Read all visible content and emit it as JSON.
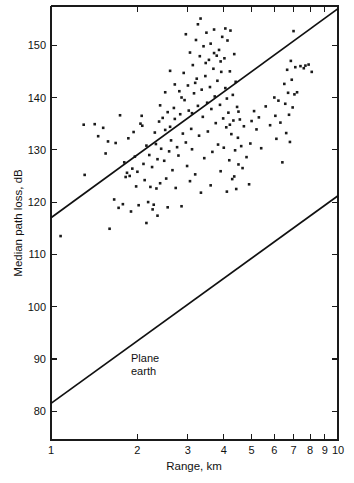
{
  "chart_data": {
    "type": "scatter",
    "title": "",
    "subtitle": "",
    "xlabel": "Range, km",
    "ylabel": "Median path loss, dB",
    "xscale": "log",
    "yscale": "linear",
    "xlim": [
      1,
      10
    ],
    "ylim": [
      74.5,
      157.5
    ],
    "grid": false,
    "legend_position": "none",
    "xticks": [
      1,
      2,
      3,
      4,
      5,
      6,
      7,
      8,
      9,
      10
    ],
    "xtick_labels": [
      "1",
      "2",
      "3",
      "4",
      "5",
      "6",
      "7",
      "8",
      "9",
      "10"
    ],
    "yticks": [
      80,
      90,
      100,
      110,
      120,
      130,
      140,
      150
    ],
    "ytick_labels": [
      "80",
      "90",
      "100",
      "110",
      "120",
      "130",
      "140",
      "150"
    ],
    "annotations": [
      {
        "name": "plane-earth-label",
        "lines": [
          "Plane",
          "earth"
        ],
        "x": 1.9,
        "y": 89.5
      }
    ],
    "series": [
      {
        "name": "measured-median-path-loss",
        "type": "scatter",
        "marker": "dot",
        "marker_size": 1.6,
        "color": "#1a1a1a",
        "points": [
          [
            1.08,
            113.5
          ],
          [
            1.3,
            134.8
          ],
          [
            1.31,
            125.2
          ],
          [
            1.42,
            134.9
          ],
          [
            1.46,
            132.6
          ],
          [
            1.52,
            134.2
          ],
          [
            1.55,
            129.3
          ],
          [
            1.58,
            131.6
          ],
          [
            1.6,
            114.9
          ],
          [
            1.66,
            120.5
          ],
          [
            1.68,
            131.3
          ],
          [
            1.72,
            118.9
          ],
          [
            1.74,
            136.6
          ],
          [
            1.78,
            119.6
          ],
          [
            1.8,
            127.6
          ],
          [
            1.82,
            124.8
          ],
          [
            1.84,
            125.6
          ],
          [
            1.86,
            132.2
          ],
          [
            1.88,
            125.0
          ],
          [
            1.9,
            118.2
          ],
          [
            1.92,
            126.4
          ],
          [
            1.94,
            133.4
          ],
          [
            1.96,
            128.7
          ],
          [
            1.98,
            123.0
          ],
          [
            2.0,
            125.8
          ],
          [
            2.02,
            119.4
          ],
          [
            2.05,
            135.0
          ],
          [
            2.08,
            134.6
          ],
          [
            2.1,
            127.3
          ],
          [
            2.12,
            124.2
          ],
          [
            2.15,
            130.8
          ],
          [
            2.18,
            120.0
          ],
          [
            2.2,
            129.0
          ],
          [
            2.22,
            122.9
          ],
          [
            2.25,
            126.7
          ],
          [
            2.28,
            119.5
          ],
          [
            2.3,
            133.3
          ],
          [
            2.32,
            131.1
          ],
          [
            2.35,
            128.2
          ],
          [
            2.38,
            135.4
          ],
          [
            2.4,
            123.6
          ],
          [
            2.42,
            130.2
          ],
          [
            2.45,
            136.1
          ],
          [
            2.48,
            127.9
          ],
          [
            2.5,
            133.8
          ],
          [
            2.52,
            124.5
          ],
          [
            2.55,
            137.2
          ],
          [
            2.58,
            129.7
          ],
          [
            2.6,
            134.4
          ],
          [
            2.62,
            131.8
          ],
          [
            2.65,
            126.1
          ],
          [
            2.68,
            138.0
          ],
          [
            2.7,
            135.9
          ],
          [
            2.72,
            122.7
          ],
          [
            2.75,
            130.5
          ],
          [
            2.78,
            128.9
          ],
          [
            2.8,
            141.2
          ],
          [
            2.82,
            136.8
          ],
          [
            2.85,
            119.2
          ],
          [
            2.88,
            133.1
          ],
          [
            2.9,
            144.7
          ],
          [
            2.92,
            139.5
          ],
          [
            2.95,
            131.4
          ],
          [
            2.98,
            126.9
          ],
          [
            3.0,
            142.3
          ],
          [
            3.02,
            137.5
          ],
          [
            3.05,
            148.6
          ],
          [
            3.08,
            134.0
          ],
          [
            3.1,
            130.1
          ],
          [
            3.12,
            146.2
          ],
          [
            3.15,
            140.8
          ],
          [
            3.18,
            125.3
          ],
          [
            3.2,
            151.0
          ],
          [
            3.22,
            143.6
          ],
          [
            3.25,
            138.4
          ],
          [
            3.28,
            132.7
          ],
          [
            3.3,
            147.9
          ],
          [
            3.32,
            155.1
          ],
          [
            3.35,
            141.5
          ],
          [
            3.38,
            136.3
          ],
          [
            3.4,
            149.8
          ],
          [
            3.42,
            128.4
          ],
          [
            3.45,
            144.1
          ],
          [
            3.48,
            152.4
          ],
          [
            3.5,
            139.0
          ],
          [
            3.52,
            133.5
          ],
          [
            3.55,
            147.2
          ],
          [
            3.58,
            142.0
          ],
          [
            3.6,
            150.3
          ],
          [
            3.62,
            137.8
          ],
          [
            3.65,
            129.6
          ],
          [
            3.68,
            145.5
          ],
          [
            3.7,
            153.0
          ],
          [
            3.72,
            140.2
          ],
          [
            3.75,
            135.1
          ],
          [
            3.78,
            148.0
          ],
          [
            3.8,
            143.2
          ],
          [
            3.82,
            131.0
          ],
          [
            3.85,
            149.1
          ],
          [
            3.88,
            138.6
          ],
          [
            3.9,
            125.9
          ],
          [
            3.92,
            144.9
          ],
          [
            3.95,
            151.6
          ],
          [
            3.98,
            136.0
          ],
          [
            4.0,
            130.4
          ],
          [
            4.02,
            147.5
          ],
          [
            4.05,
            141.8
          ],
          [
            4.08,
            134.3
          ],
          [
            4.1,
            122.0
          ],
          [
            4.12,
            150.9
          ],
          [
            4.15,
            137.1
          ],
          [
            4.18,
            128.0
          ],
          [
            4.2,
            145.0
          ],
          [
            4.22,
            152.8
          ],
          [
            4.25,
            133.0
          ],
          [
            4.28,
            124.4
          ],
          [
            4.3,
            140.5
          ],
          [
            4.32,
            135.6
          ],
          [
            4.35,
            148.3
          ],
          [
            4.38,
            129.9
          ],
          [
            4.4,
            143.0
          ],
          [
            4.42,
            122.5
          ],
          [
            4.45,
            138.2
          ],
          [
            4.48,
            132.3
          ],
          [
            4.5,
            127.2
          ],
          [
            4.55,
            135.8
          ],
          [
            4.6,
            130.7
          ],
          [
            4.65,
            126.5
          ],
          [
            4.7,
            134.5
          ],
          [
            4.8,
            128.6
          ],
          [
            4.9,
            123.4
          ],
          [
            5.1,
            137.4
          ],
          [
            5.2,
            133.9
          ],
          [
            5.3,
            136.2
          ],
          [
            5.4,
            130.3
          ],
          [
            5.6,
            138.3
          ],
          [
            5.8,
            134.7
          ],
          [
            6.0,
            140.0
          ],
          [
            6.05,
            136.5
          ],
          [
            6.1,
            132.1
          ],
          [
            6.2,
            139.4
          ],
          [
            6.3,
            135.2
          ],
          [
            6.4,
            127.6
          ],
          [
            6.5,
            142.6
          ],
          [
            6.55,
            138.8
          ],
          [
            6.6,
            133.2
          ],
          [
            6.65,
            145.3
          ],
          [
            6.7,
            140.9
          ],
          [
            6.75,
            136.7
          ],
          [
            6.8,
            131.5
          ],
          [
            6.85,
            147.0
          ],
          [
            6.9,
            143.4
          ],
          [
            6.95,
            138.1
          ],
          [
            7.0,
            152.7
          ],
          [
            7.05,
            140.6
          ],
          [
            7.1,
            145.8
          ],
          [
            7.2,
            141.0
          ],
          [
            7.4,
            146.0
          ],
          [
            7.6,
            145.6
          ],
          [
            7.7,
            146.1
          ],
          [
            7.9,
            146.3
          ],
          [
            8.1,
            144.9
          ],
          [
            2.07,
            136.5
          ],
          [
            2.26,
            118.6
          ],
          [
            2.55,
            119.0
          ],
          [
            2.33,
            122.6
          ],
          [
            3.05,
            124.0
          ],
          [
            3.33,
            121.8
          ],
          [
            3.6,
            123.2
          ],
          [
            3.18,
            142.8
          ],
          [
            3.46,
            146.6
          ],
          [
            3.7,
            148.5
          ],
          [
            3.9,
            146.9
          ],
          [
            4.05,
            153.2
          ],
          [
            3.25,
            154.0
          ],
          [
            2.95,
            152.1
          ],
          [
            3.1,
            137.0
          ],
          [
            2.85,
            140.0
          ],
          [
            2.7,
            142.5
          ],
          [
            2.6,
            145.1
          ],
          [
            2.5,
            141.0
          ],
          [
            2.4,
            138.5
          ],
          [
            4.5,
            137.3
          ],
          [
            4.35,
            124.9
          ],
          [
            4.2,
            134.8
          ],
          [
            4.1,
            139.8
          ],
          [
            5.0,
            135.5
          ],
          [
            4.95,
            131.2
          ],
          [
            2.15,
            116.0
          ],
          [
            2.35,
            117.4
          ]
        ]
      }
    ],
    "lines": [
      {
        "name": "measured-regression-line",
        "label": "",
        "points": [
          [
            1,
            117.0
          ],
          [
            10,
            157.0
          ]
        ],
        "color": "#111111"
      },
      {
        "name": "plane-earth-line",
        "label": "Plane earth",
        "points": [
          [
            1,
            81.5
          ],
          [
            10,
            121.2
          ]
        ],
        "color": "#111111"
      }
    ]
  }
}
